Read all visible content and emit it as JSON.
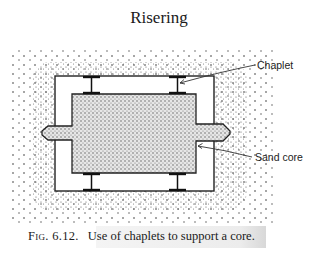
{
  "header": {
    "title": "Risering"
  },
  "figure": {
    "labels": {
      "chaplet": "Chaplet",
      "sand_core": "Sand core"
    },
    "elements": [
      "mold sand",
      "mold cavity",
      "sand core",
      "core prints",
      "chaplets"
    ]
  },
  "caption": {
    "number": "Fig. 6.12.",
    "text": "Use of chaplets to support a core."
  }
}
